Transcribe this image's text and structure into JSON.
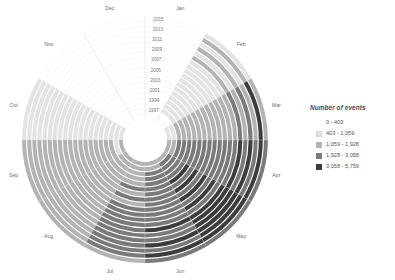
{
  "legend": {
    "title": "Number of events",
    "entries": [
      {
        "label": "0 - 403",
        "color": "#ffffff",
        "border": "#ffffff"
      },
      {
        "label": "403 - 1,059",
        "color": "#e3e3e3",
        "border": "#d8d8d8"
      },
      {
        "label": "1,059 - 1,928",
        "color": "#b3b3b3",
        "border": "#b3b3b3"
      },
      {
        "label": "1,928 - 3,058",
        "color": "#7a7a7a",
        "border": "#7a7a7a"
      },
      {
        "label": "3,058 - 5,759",
        "color": "#3d3d3d",
        "border": "#3d3d3d"
      }
    ]
  },
  "chart_data": {
    "type": "heatmap",
    "title": "",
    "subtitle": "",
    "xlabel": "",
    "ylabel": "",
    "legend_position": "right",
    "grid": true,
    "projection": "polar",
    "angular_axis": {
      "name": "Month",
      "categories": [
        "Jan",
        "Feb",
        "Mar",
        "Apr",
        "May",
        "Jun",
        "Jul",
        "Aug",
        "Sep",
        "Oct",
        "Nov",
        "Dec"
      ],
      "start_angle_deg": 0,
      "direction": "clockwise"
    },
    "radial_axis": {
      "name": "Year",
      "categories": [
        1997,
        1998,
        1999,
        2000,
        2001,
        2002,
        2003,
        2004,
        2005,
        2006,
        2007,
        2008,
        2009,
        2010,
        2011,
        2012,
        2013,
        2014,
        2015,
        2016
      ],
      "tick_labels": [
        "2015",
        "2013",
        "2011",
        "2009",
        "2007",
        "2005",
        "2003",
        "2001",
        "1999",
        "1997"
      ],
      "inner_first": true
    },
    "color_scale": {
      "type": "binned-sequential-gray",
      "bins": [
        {
          "min": 0,
          "max": 403,
          "color": "#ffffff"
        },
        {
          "min": 403,
          "max": 1059,
          "color": "#e3e3e3"
        },
        {
          "min": 1059,
          "max": 1928,
          "color": "#b3b3b3"
        },
        {
          "min": 1928,
          "max": 3058,
          "color": "#7a7a7a"
        },
        {
          "min": 3058,
          "max": 5759,
          "color": "#3d3d3d"
        }
      ]
    },
    "bin_index_matrix": {
      "note": "rows = years 1997..2016 (inner ring first); columns = months Jan..Dec; value = color bin index 0-4",
      "rows": [
        {
          "year": 1997,
          "bins": [
            0,
            0,
            1,
            2,
            2,
            2,
            2,
            2,
            2,
            1,
            0,
            0
          ]
        },
        {
          "year": 1998,
          "bins": [
            0,
            0,
            1,
            2,
            3,
            2,
            2,
            2,
            1,
            1,
            0,
            0
          ]
        },
        {
          "year": 1999,
          "bins": [
            0,
            1,
            2,
            3,
            3,
            3,
            2,
            2,
            2,
            1,
            0,
            0
          ]
        },
        {
          "year": 2000,
          "bins": [
            0,
            1,
            2,
            3,
            3,
            3,
            2,
            2,
            2,
            1,
            0,
            0
          ]
        },
        {
          "year": 2001,
          "bins": [
            0,
            1,
            2,
            3,
            3,
            3,
            2,
            2,
            2,
            1,
            0,
            0
          ]
        },
        {
          "year": 2002,
          "bins": [
            0,
            1,
            2,
            3,
            4,
            3,
            3,
            2,
            2,
            1,
            0,
            0
          ]
        },
        {
          "year": 2003,
          "bins": [
            0,
            1,
            2,
            3,
            3,
            3,
            2,
            2,
            2,
            1,
            0,
            0
          ]
        },
        {
          "year": 2004,
          "bins": [
            0,
            1,
            2,
            3,
            4,
            3,
            3,
            2,
            2,
            1,
            0,
            0
          ]
        },
        {
          "year": 2005,
          "bins": [
            0,
            1,
            2,
            3,
            3,
            3,
            2,
            2,
            2,
            1,
            0,
            0
          ]
        },
        {
          "year": 2006,
          "bins": [
            0,
            1,
            2,
            3,
            4,
            3,
            3,
            2,
            2,
            1,
            0,
            0
          ]
        },
        {
          "year": 2007,
          "bins": [
            0,
            1,
            2,
            3,
            3,
            3,
            3,
            2,
            2,
            1,
            0,
            0
          ]
        },
        {
          "year": 2008,
          "bins": [
            0,
            1,
            2,
            3,
            4,
            3,
            3,
            2,
            2,
            1,
            0,
            0
          ]
        },
        {
          "year": 2009,
          "bins": [
            0,
            1,
            2,
            3,
            3,
            3,
            3,
            2,
            2,
            1,
            0,
            0
          ]
        },
        {
          "year": 2010,
          "bins": [
            0,
            1,
            2,
            3,
            4,
            4,
            3,
            2,
            2,
            1,
            0,
            0
          ]
        },
        {
          "year": 2011,
          "bins": [
            0,
            2,
            3,
            4,
            4,
            3,
            3,
            2,
            2,
            1,
            0,
            0
          ]
        },
        {
          "year": 2012,
          "bins": [
            0,
            1,
            2,
            3,
            4,
            3,
            3,
            2,
            2,
            1,
            0,
            0
          ]
        },
        {
          "year": 2013,
          "bins": [
            0,
            2,
            3,
            4,
            4,
            4,
            3,
            2,
            2,
            1,
            0,
            0
          ]
        },
        {
          "year": 2014,
          "bins": [
            0,
            1,
            2,
            3,
            4,
            3,
            3,
            2,
            2,
            1,
            0,
            0
          ]
        },
        {
          "year": 2015,
          "bins": [
            0,
            2,
            4,
            4,
            4,
            4,
            3,
            2,
            2,
            1,
            0,
            0
          ]
        },
        {
          "year": 2016,
          "bins": [
            0,
            1,
            2,
            3,
            3,
            3,
            2,
            2,
            2,
            1,
            0,
            0
          ]
        }
      ]
    }
  },
  "geometry": {
    "cx": 145,
    "cy": 140,
    "inner_radius": 22,
    "outer_radius": 124,
    "month_label_radius": 136,
    "year_label_angle_deg": 3
  }
}
